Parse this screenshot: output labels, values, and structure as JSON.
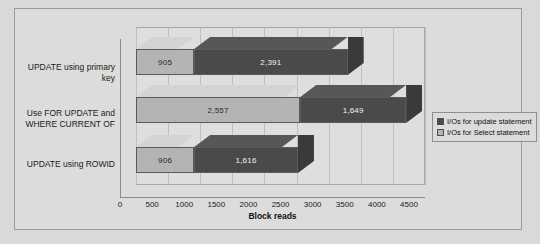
{
  "chart_data": {
    "type": "bar",
    "orientation": "horizontal",
    "stacked": true,
    "style": "3d",
    "title": "",
    "xlabel": "Block reads",
    "ylabel": "",
    "xlim": [
      0,
      4500
    ],
    "grid": true,
    "legend_position": "right",
    "categories": [
      "UPDATE using primary key",
      "Use FOR UPDATE and WHERE CURRENT OF",
      "UPDATE using ROWID"
    ],
    "tick_labels": [
      "0",
      "500",
      "1000",
      "1500",
      "2000",
      "2500",
      "3000",
      "3500",
      "4000",
      "4500"
    ],
    "tick_values": [
      0,
      500,
      1000,
      1500,
      2000,
      2500,
      3000,
      3500,
      4000,
      4500
    ],
    "series": [
      {
        "name": "I/Os for Select statement",
        "color": "#b4b4b4",
        "values": [
          905,
          2557,
          906
        ],
        "labels": [
          "905",
          "2,557",
          "906"
        ]
      },
      {
        "name": "I/Os for update statement",
        "color": "#4a4a4a",
        "values": [
          2391,
          1649,
          1616
        ],
        "labels": [
          "2,391",
          "1,649",
          "1,616"
        ]
      }
    ],
    "totals": [
      3296,
      4206,
      2522
    ]
  },
  "legend": {
    "items": [
      {
        "label": "I/Os for update statement",
        "color": "#4a4a4a"
      },
      {
        "label": "I/Os for Select statement",
        "color": "#b4b4b4"
      }
    ]
  },
  "colors": {
    "page_background": "#d9d9d9",
    "canvas_background": "#dcdcdc",
    "plot_background": "#dedede",
    "gridline": "#bfbfbf",
    "axis": "#8a8a8a",
    "series_select": "#b4b4b4",
    "series_update": "#4a4a4a",
    "bar_outline": "#5a5a5a",
    "text": "#1a1a1a"
  }
}
